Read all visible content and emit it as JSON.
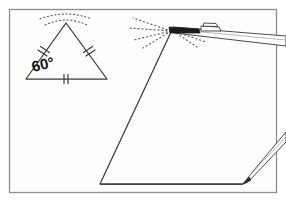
{
  "figure": {
    "background_color": "#fdfdfc",
    "ink_color": "#3a3a3a",
    "dark_ink_color": "#1a1a1a",
    "frame": {
      "name": "diagram-border",
      "x": 9,
      "y": 9,
      "width": 268,
      "height": 184,
      "stroke": "#8e8e8e"
    },
    "small_triangle": {
      "label": "reference equilateral triangle",
      "apex": [
        66,
        23
      ],
      "bottom_left": [
        26,
        79
      ],
      "bottom_right": [
        107,
        79
      ],
      "angle_label": "60°",
      "angle_label_x": 33,
      "angle_label_y": 72,
      "angle_label_rotation": -13,
      "tick_marks": "double ticks on all three sides",
      "tick_count_per_side": 2
    },
    "large_triangle": {
      "label": "triangle being constructed",
      "apex": [
        172,
        30
      ],
      "bottom_left": [
        100,
        184
      ],
      "bottom_right": [
        243,
        184
      ]
    },
    "dotted_rays": {
      "label": "construction guide rays",
      "small_arc_center": [
        66,
        23
      ],
      "large_fan_center": [
        172,
        30
      ],
      "stroke": "#5a5a5a"
    },
    "straightedge": {
      "label": "ruler resting on apex",
      "name": "straightedge-tool"
    },
    "pencil": {
      "label": "pencil marking the vertex",
      "name": "pencil-tool",
      "tip": [
        243,
        184
      ]
    }
  }
}
